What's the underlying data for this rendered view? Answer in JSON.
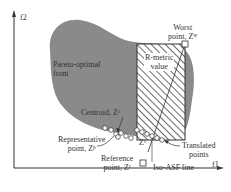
{
  "axes": {
    "x_label": "f1",
    "y_label": "f2"
  },
  "labels": {
    "pareto_front": [
      "Pareto-optimal",
      "front"
    ],
    "r_metric": [
      "R-metric",
      "value"
    ],
    "worst_point": [
      "Worst",
      "point, Z"
    ],
    "worst_sup": "w",
    "centroid": "Centroid, Z",
    "centroid_sup": "c",
    "representative": [
      "Representative",
      "point, Z"
    ],
    "representative_sup": "p",
    "reference": [
      "Reference",
      "point, Z"
    ],
    "reference_sup": "r",
    "translated_z": "Z",
    "translated_z_sup": "t",
    "iso_asf": "Iso-ASF line",
    "translated_points": [
      "Translated",
      "points"
    ]
  },
  "colors": {
    "region": "#8a8a8a",
    "axis": "#333333",
    "hatch": "#444444",
    "background": "#ffffff"
  }
}
